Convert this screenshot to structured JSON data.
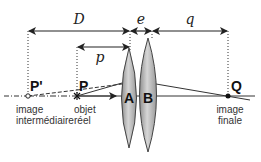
{
  "diagram": {
    "dimensions": {
      "D": "D",
      "e": "e",
      "q": "q",
      "p": "p"
    },
    "points": {
      "p_prime": "P'",
      "p": "P",
      "q": "Q"
    },
    "lenses": {
      "a": "A",
      "b": "B"
    },
    "captions": {
      "p_prime_line1": "image",
      "p_prime_line2": "intermédiaire",
      "p_line1": "objet",
      "p_line2": "réel",
      "q_line1": "image",
      "q_line2": "finale"
    },
    "colors": {
      "lens_fill": "#b8b8b8",
      "line": "#222222",
      "background": "#ffffff"
    }
  }
}
